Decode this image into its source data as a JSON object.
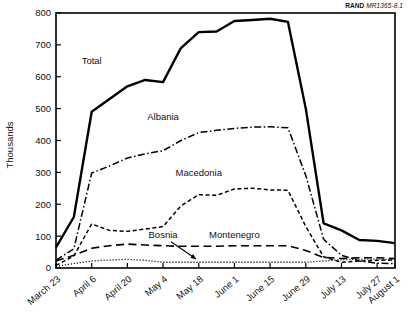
{
  "figure": {
    "source_tag_bold": "RAND",
    "source_tag_italic": "MR1365-8.1"
  },
  "chart_data": {
    "type": "line",
    "title": "",
    "subtitle": "",
    "xlabel": "",
    "ylabel": "Thousands",
    "ylim": [
      0,
      800
    ],
    "yticks": [
      0,
      100,
      200,
      300,
      400,
      500,
      600,
      700,
      800
    ],
    "ytick_labels": [
      "0",
      "100",
      "200",
      "300",
      "400",
      "500",
      "600",
      "700",
      "800"
    ],
    "grid": false,
    "legend_position": "inline-annotations",
    "x": [
      "March 23",
      "March 30",
      "April 6",
      "April 13",
      "April 20",
      "April 27",
      "May 4",
      "May 11",
      "May 18",
      "May 25",
      "June 1",
      "June 8",
      "June 15",
      "June 22",
      "June 29",
      "July 6",
      "July 13",
      "July 20",
      "July 27",
      "August 1"
    ],
    "xtick_labels": [
      "March 23",
      "April 6",
      "April 20",
      "May 4",
      "May 18",
      "June 1",
      "June 15",
      "June 29",
      "July 13",
      "July 27",
      "August 1"
    ],
    "series": [
      {
        "name": "Total",
        "style": "solid",
        "values": [
          65,
          160,
          490,
          530,
          570,
          590,
          583,
          690,
          740,
          742,
          775,
          778,
          782,
          772,
          500,
          140,
          118,
          88,
          85,
          78
        ]
      },
      {
        "name": "Albania",
        "style": "dash-dot",
        "values": [
          25,
          60,
          298,
          320,
          345,
          358,
          368,
          400,
          425,
          432,
          438,
          442,
          443,
          440,
          290,
          90,
          40,
          22,
          15,
          14
        ]
      },
      {
        "name": "Macedonia",
        "style": "short-dash",
        "values": [
          8,
          38,
          138,
          118,
          115,
          122,
          130,
          195,
          230,
          228,
          248,
          250,
          245,
          244,
          130,
          35,
          18,
          22,
          24,
          25
        ]
      },
      {
        "name": "Montenegro",
        "style": "long-dash",
        "values": [
          22,
          40,
          62,
          70,
          75,
          72,
          70,
          68,
          68,
          68,
          70,
          70,
          70,
          70,
          55,
          33,
          30,
          32,
          32,
          30
        ]
      },
      {
        "name": "Bosnia",
        "style": "dotted",
        "values": [
          5,
          14,
          22,
          25,
          27,
          24,
          18,
          18,
          18,
          18,
          18,
          18,
          18,
          18,
          18,
          22,
          26,
          28,
          28,
          26
        ]
      }
    ],
    "annotations": [
      {
        "label": "Total",
        "x": "April 6",
        "y": 640
      },
      {
        "label": "Albania",
        "x": "May 4",
        "y": 465
      },
      {
        "label": "Macedonia",
        "x": "May 18",
        "y": 290
      },
      {
        "label": "Bosnia",
        "x": "May 4",
        "y": 95,
        "leader": true
      },
      {
        "label": "Montenegro",
        "x": "June 1",
        "y": 95
      }
    ]
  }
}
